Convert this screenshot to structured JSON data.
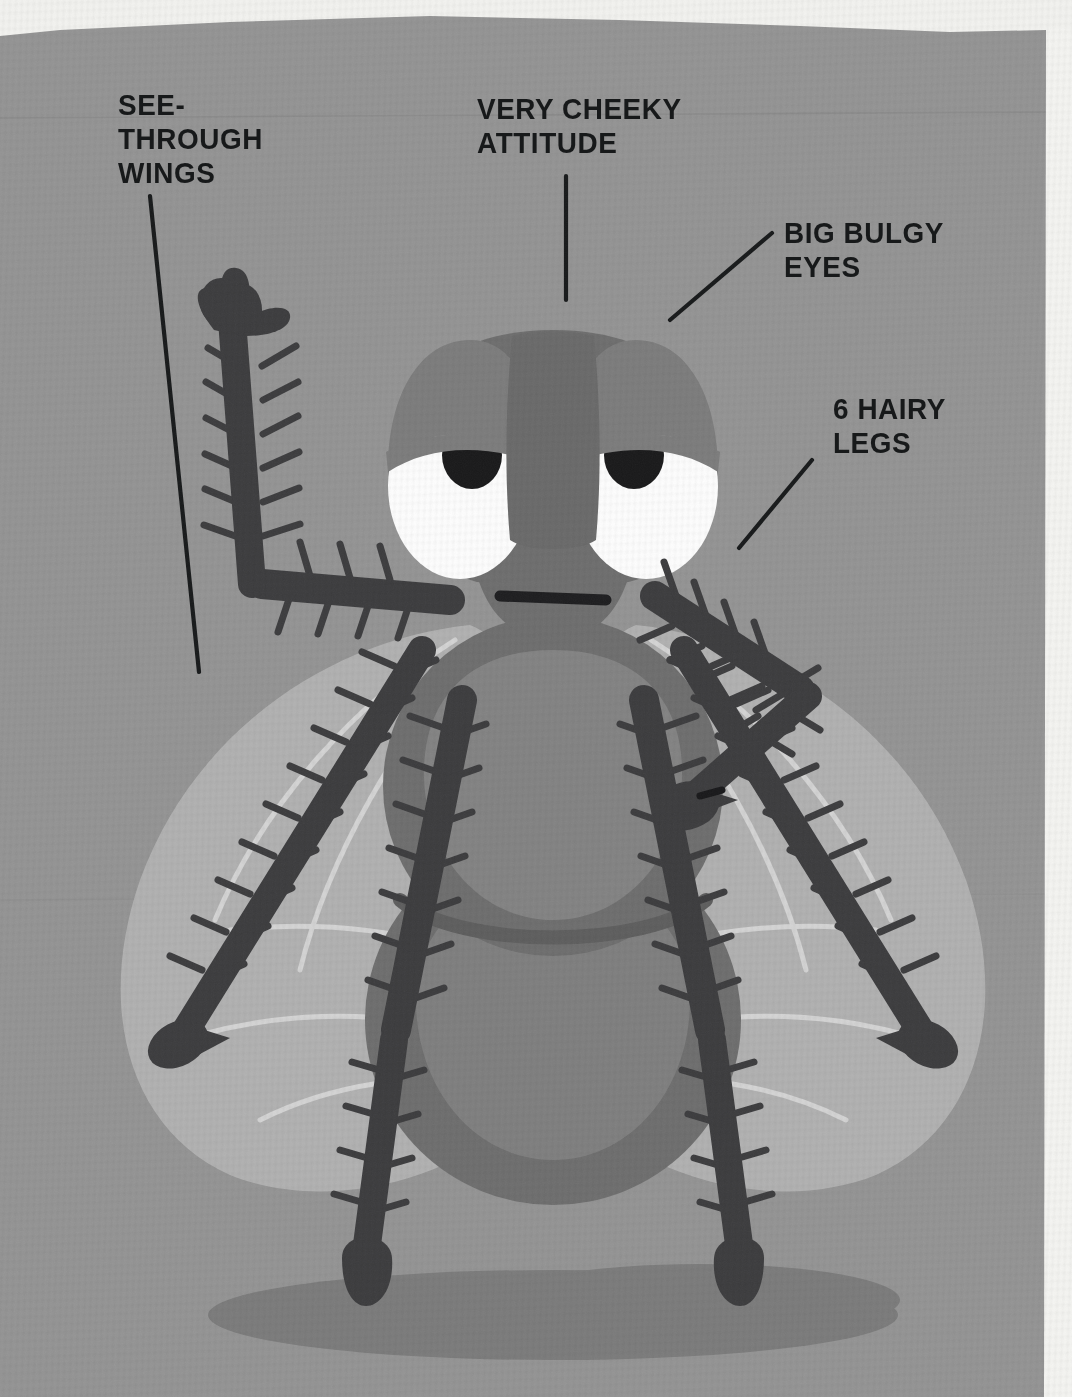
{
  "illustration": {
    "subject": "housefly",
    "style": "flat vector cartoon on textured gray paper",
    "title_text": "",
    "background_color": "#949494",
    "paper_edge_color": "#f2f2ef"
  },
  "callouts": [
    {
      "id": "see-through-wings",
      "text": "SEE-\nTHROUGH\nWINGS",
      "color": "#17191a",
      "leader_line": {
        "x1": 150,
        "y1": 196,
        "x2": 199,
        "y2": 672
      }
    },
    {
      "id": "very-cheeky-attitude",
      "text": "VERY CHEEKY\nATTITUDE",
      "color": "#17191a",
      "leader_line": {
        "x1": 566,
        "y1": 176,
        "x2": 566,
        "y2": 300
      }
    },
    {
      "id": "big-bulgy-eyes",
      "text": "BIG BULGY\nEYES",
      "color": "#17191a",
      "leader_line": {
        "x1": 772,
        "y1": 233,
        "x2": 670,
        "y2": 320
      }
    },
    {
      "id": "6-hairy-legs",
      "text": "6 HAIRY\nLEGS",
      "color": "#17191a",
      "leader_line": {
        "x1": 812,
        "y1": 460,
        "x2": 739,
        "y2": 548
      }
    }
  ],
  "palette": {
    "background": "#949494",
    "paper_edge": "#f2f2ef",
    "body_dark": "#6b6b6b",
    "body_mid": "#767676",
    "body_light": "#8d8d8d",
    "head_face": "#6e6e6e",
    "eye_dome": "#7c7c7c",
    "eye_white": "#fdfdfd",
    "pupil": "#19191a",
    "leg_dark": "#3c3c3e",
    "wing_fill": "#b4b4b4",
    "wing_vein": "#d2d2d2",
    "shadow": "#7b7b7b",
    "mouth": "#1d1d1f"
  },
  "anatomy": {
    "parts": [
      {
        "name": "head",
        "label": "head"
      },
      {
        "name": "compound-eyes",
        "label": "big bulgy eyes",
        "count": 2
      },
      {
        "name": "wings",
        "label": "see-through wings",
        "count": 2
      },
      {
        "name": "legs",
        "label": "hairy legs",
        "count": 6
      },
      {
        "name": "thorax",
        "label": "thorax"
      },
      {
        "name": "abdomen",
        "label": "abdomen"
      },
      {
        "name": "mouth",
        "label": "flat frowning mouth"
      },
      {
        "name": "shadow",
        "label": "ground shadow"
      }
    ]
  }
}
